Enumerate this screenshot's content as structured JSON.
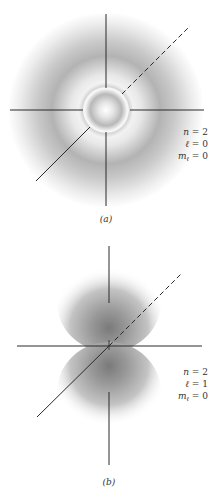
{
  "figures": [
    {
      "id": "a",
      "caption": "(a)",
      "orbital": "2s",
      "quantum_numbers": {
        "n_label": "n",
        "n_value": "2",
        "l_label": "ℓ",
        "l_value": "0",
        "ml_label": "m",
        "ml_sub": "ℓ",
        "ml_value": "0"
      },
      "description": "Spherically symmetric probability density with inner bright core and outer gray shell"
    },
    {
      "id": "b",
      "caption": "(b)",
      "orbital": "2p (mℓ = 0)",
      "quantum_numbers": {
        "n_label": "n",
        "n_value": "2",
        "l_label": "ℓ",
        "l_value": "1",
        "ml_label": "m",
        "ml_sub": "ℓ",
        "ml_value": "0"
      },
      "description": "Two lobes along the vertical axis with a nodal plane at the origin"
    }
  ],
  "colors": {
    "axis": "#2a2a2a",
    "shade_dark": "#7a7a7a",
    "background": "#ffffff",
    "text": "#333333"
  }
}
